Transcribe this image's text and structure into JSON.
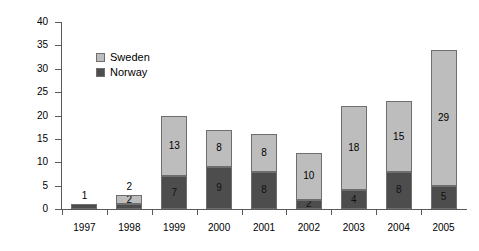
{
  "chart_data": {
    "type": "bar",
    "stacked": true,
    "title": "",
    "xlabel": "",
    "ylabel": "Number of attacked dogs",
    "ylim": [
      0,
      40
    ],
    "yticks": [
      0,
      5,
      10,
      15,
      20,
      25,
      30,
      35,
      40
    ],
    "grid": false,
    "legend_position": "upper-left-inside",
    "categories": [
      "1997",
      "1998",
      "1999",
      "2000",
      "2001",
      "2002",
      "2003",
      "2004",
      "2005"
    ],
    "series": [
      {
        "name": "Norway",
        "color": "#4d4d4d",
        "values": [
          1,
          1,
          7,
          9,
          8,
          2,
          4,
          8,
          5
        ],
        "labels": [
          "",
          "",
          "7",
          "9",
          "8",
          "2",
          "4",
          "8",
          "5"
        ]
      },
      {
        "name": "Sweden",
        "color": "#bdbdbd",
        "values": [
          0,
          2,
          13,
          8,
          8,
          10,
          18,
          15,
          29
        ],
        "labels": [
          "",
          "2",
          "13",
          "8",
          "8",
          "10",
          "18",
          "15",
          "29"
        ]
      }
    ],
    "bar_top_labels": [
      "1",
      "2",
      "",
      "",
      "",
      "",
      "",
      "",
      ""
    ],
    "totals": [
      1,
      3,
      20,
      17,
      16,
      12,
      22,
      23,
      34
    ]
  },
  "legend": {
    "items": [
      {
        "label": "Sweden",
        "swatch": "sweden-swatch"
      },
      {
        "label": "Norway",
        "swatch": "norway-swatch"
      }
    ]
  }
}
